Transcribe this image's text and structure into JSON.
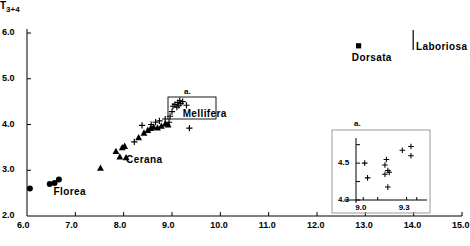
{
  "figure": {
    "ylabel": "T",
    "ylabel_sub": "3+4",
    "inset_marker_label": "a.",
    "callout_box_label": "a."
  },
  "axes": {
    "x": {
      "min": 6.0,
      "max": 15.0,
      "ticks": [
        6.0,
        7.0,
        8.0,
        9.0,
        10.0,
        11.0,
        12.0,
        13.0,
        14.0,
        15.0
      ],
      "ticklabels": [
        "6.0",
        "7.0",
        "8.0",
        "9.0",
        "10.0",
        "11.0",
        "12.0",
        "13.0",
        "14.0",
        "15.0"
      ]
    },
    "y": {
      "min": 2.0,
      "max": 6.0,
      "ticks": [
        2.0,
        3.0,
        4.0,
        5.0,
        6.0
      ],
      "ticklabels": [
        "2.0",
        "3.0",
        "4.0",
        "5.0",
        "6.0"
      ]
    }
  },
  "species_labels": [
    {
      "name": "Florea",
      "text": "Florea",
      "x": 6.55,
      "y": 2.52
    },
    {
      "name": "Cerana",
      "text": "Cerana",
      "x": 8.05,
      "y": 3.22
    },
    {
      "name": "Mellifera",
      "text": "Mellifera",
      "x": 9.22,
      "y": 4.23
    },
    {
      "name": "Dorsata",
      "text": "Dorsata",
      "x": 12.72,
      "y": 5.45
    },
    {
      "name": "Laboriosa",
      "text": "Laboriosa",
      "x": 14.05,
      "y": 5.7
    }
  ],
  "inset": {
    "label": "a.",
    "x": {
      "min": 8.95,
      "max": 9.42,
      "ticks": [
        9.0,
        9.3
      ],
      "ticklabels": [
        "9.0",
        "9.3"
      ]
    },
    "y": {
      "min": 4.3,
      "max": 4.62,
      "ticks": [
        4.3,
        4.5
      ],
      "ticklabels": [
        "4.3",
        "4.5"
      ]
    }
  },
  "chart_data": {
    "type": "scatter",
    "title": "",
    "xlabel": "",
    "ylabel": "T3+4",
    "xlim": [
      6.0,
      15.0
    ],
    "ylim": [
      2.0,
      6.0
    ],
    "grid": false,
    "legend": "inline-labels",
    "series": [
      {
        "name": "Florea",
        "marker": "filled-circle",
        "color": "#000000",
        "points": [
          {
            "x": 6.06,
            "y": 2.6
          },
          {
            "x": 6.47,
            "y": 2.7
          },
          {
            "x": 6.57,
            "y": 2.72
          },
          {
            "x": 6.66,
            "y": 2.8
          }
        ]
      },
      {
        "name": "Cerana",
        "marker": "filled-triangle",
        "color": "#000000",
        "points": [
          {
            "x": 7.52,
            "y": 3.05
          },
          {
            "x": 7.84,
            "y": 3.42
          },
          {
            "x": 7.92,
            "y": 3.3
          },
          {
            "x": 7.97,
            "y": 3.5
          },
          {
            "x": 8.02,
            "y": 3.53
          },
          {
            "x": 8.05,
            "y": 3.28
          },
          {
            "x": 8.31,
            "y": 3.72
          },
          {
            "x": 8.42,
            "y": 3.82
          },
          {
            "x": 8.5,
            "y": 3.88
          },
          {
            "x": 8.56,
            "y": 3.92
          },
          {
            "x": 8.62,
            "y": 3.95
          },
          {
            "x": 8.7,
            "y": 3.93
          },
          {
            "x": 8.78,
            "y": 3.97
          },
          {
            "x": 8.86,
            "y": 4.02
          },
          {
            "x": 8.92,
            "y": 4.0
          }
        ]
      },
      {
        "name": "Mellifera",
        "marker": "plus",
        "color": "#000000",
        "points": [
          {
            "x": 8.22,
            "y": 3.62
          },
          {
            "x": 8.38,
            "y": 3.98
          },
          {
            "x": 8.57,
            "y": 4.0
          },
          {
            "x": 8.66,
            "y": 4.05
          },
          {
            "x": 8.74,
            "y": 4.08
          },
          {
            "x": 8.86,
            "y": 4.12
          },
          {
            "x": 8.94,
            "y": 4.05
          },
          {
            "x": 8.96,
            "y": 4.18
          },
          {
            "x": 9.0,
            "y": 4.28
          },
          {
            "x": 9.02,
            "y": 4.4
          },
          {
            "x": 9.06,
            "y": 4.44
          },
          {
            "x": 9.1,
            "y": 4.38
          },
          {
            "x": 9.12,
            "y": 4.48
          },
          {
            "x": 9.14,
            "y": 4.42
          },
          {
            "x": 9.16,
            "y": 4.52
          },
          {
            "x": 9.18,
            "y": 4.46
          },
          {
            "x": 9.22,
            "y": 4.5
          },
          {
            "x": 9.3,
            "y": 4.42
          },
          {
            "x": 9.36,
            "y": 3.92
          }
        ]
      },
      {
        "name": "Dorsata",
        "marker": "filled-square",
        "color": "#000000",
        "points": [
          {
            "x": 12.86,
            "y": 5.72
          }
        ]
      },
      {
        "name": "Laboriosa",
        "marker": "vertical-bar",
        "color": "#000000",
        "points": [
          {
            "x": 13.99,
            "y": 6.0
          }
        ]
      }
    ],
    "inset_points": {
      "marker": "plus",
      "points": [
        {
          "x": 9.01,
          "y": 4.5
        },
        {
          "x": 9.03,
          "y": 4.42
        },
        {
          "x": 9.15,
          "y": 4.49
        },
        {
          "x": 9.16,
          "y": 4.52
        },
        {
          "x": 9.17,
          "y": 4.46
        },
        {
          "x": 9.15,
          "y": 4.44
        },
        {
          "x": 9.18,
          "y": 4.45
        },
        {
          "x": 9.17,
          "y": 4.37
        },
        {
          "x": 9.27,
          "y": 4.57
        },
        {
          "x": 9.33,
          "y": 4.59
        },
        {
          "x": 9.33,
          "y": 4.54
        }
      ]
    }
  }
}
